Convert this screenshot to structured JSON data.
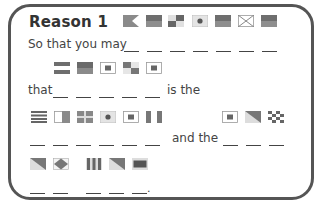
{
  "card": {
    "title": "Reason 1",
    "line1_text": "So that you may",
    "line2_text": "that",
    "line2_suffix": "is the",
    "line3_text": "and the",
    "final_punct": "."
  },
  "puzzle": {
    "row1_flags": [
      "A",
      "B",
      "N",
      "J",
      "R",
      "X",
      "E"
    ],
    "row1_flag_desc": [
      "swallowtail-half",
      "solid-gradient",
      "checker-quarters",
      "dot-center",
      "solid-gradient",
      "diagonal-cross",
      "solid-gradient"
    ],
    "row1_blank_count": 7,
    "row2_flags": [
      "=",
      "B",
      "S",
      "N",
      "S"
    ],
    "row2_flag_desc": [
      "horizontal-stripes",
      "solid",
      "square-in-square",
      "checker-quarters",
      "square-in-square"
    ],
    "row2_blank_count": 5,
    "row3a_flags": [
      "H-stripes",
      "vertical-half",
      "cross-quarters",
      "dot-center",
      "square-in-square",
      "vertical-thirds"
    ],
    "row3a_blank_count": 6,
    "row3b_flags": [
      "square-in-square",
      "diagonal-half",
      "checkerboard"
    ],
    "row3b_blank_count": 3,
    "row4a_flags": [
      "diagonal-half",
      "diamond"
    ],
    "row4a_blank_count": 2,
    "row4b_flags": [
      "vertical-stripes",
      "diagonal-half",
      "bordered-rectangle"
    ],
    "row4b_blank_count": 3
  },
  "colors": {
    "flag_dark": "#6e6e6e",
    "flag_mid": "#9a9a9a",
    "flag_light": "#d8d8d8",
    "border": "#555555"
  }
}
